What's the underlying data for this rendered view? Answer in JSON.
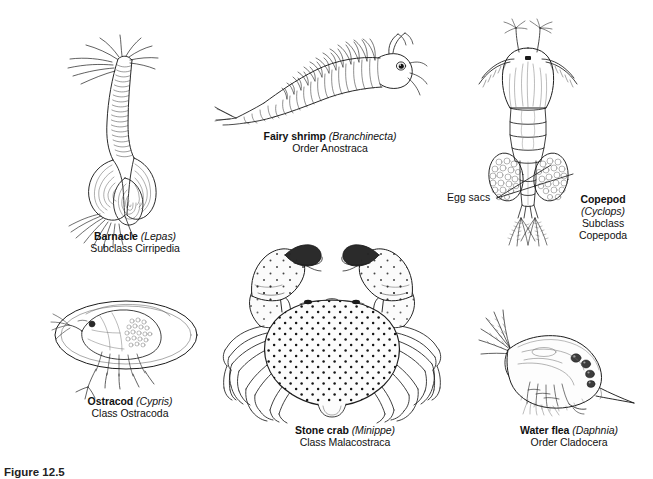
{
  "figure": {
    "caption": "Figure 12.5",
    "background_color": "#ffffff",
    "ink_color": "#1a1a1a"
  },
  "organisms": [
    {
      "id": "barnacle",
      "common_name": "Barnacle",
      "genus": "(Lepas)",
      "taxon": "Subclass Cirripedia",
      "description": "goose barnacle with long flexible stalk and plated capitulum with feeding cirri"
    },
    {
      "id": "fairy-shrimp",
      "common_name": "Fairy shrimp",
      "genus": "(Branchinecta)",
      "taxon": "Order Anostraca",
      "description": "elongate swimming crustacean with paired phyllopodous legs, stalked eye, and forked tail"
    },
    {
      "id": "copepod",
      "common_name": "Copepod",
      "genus": "(Cyclops)",
      "taxon_lines": [
        "Subclass",
        "Copepoda"
      ],
      "description": "teardrop body with long first antennae, paired lateral egg sacs and two caudal rami with setae"
    },
    {
      "id": "ostracod",
      "common_name": "Ostracod",
      "genus": "(Cypris)",
      "taxon": "Class Ostracoda",
      "description": "seed shrimp enclosed in a bivalved oval carapace with legs and antennae protruding"
    },
    {
      "id": "stone-crab",
      "common_name": "Stone crab",
      "genus": "(Minippe)",
      "taxon": "Class Malacostraca",
      "description": "broad speckled carapace with two large raised chelipeds and four pairs of walking legs"
    },
    {
      "id": "water-flea",
      "common_name": "Water flea",
      "genus": "(Daphnia)",
      "taxon": "Order Cladocera",
      "description": "rounded transparent carapace with branched swimming antennae, brood eggs and posterior tail spine"
    }
  ],
  "callouts": [
    {
      "id": "egg-sacs",
      "text": "Egg sacs",
      "points_to": "copepod egg sacs",
      "leader_count": 2
    }
  ]
}
